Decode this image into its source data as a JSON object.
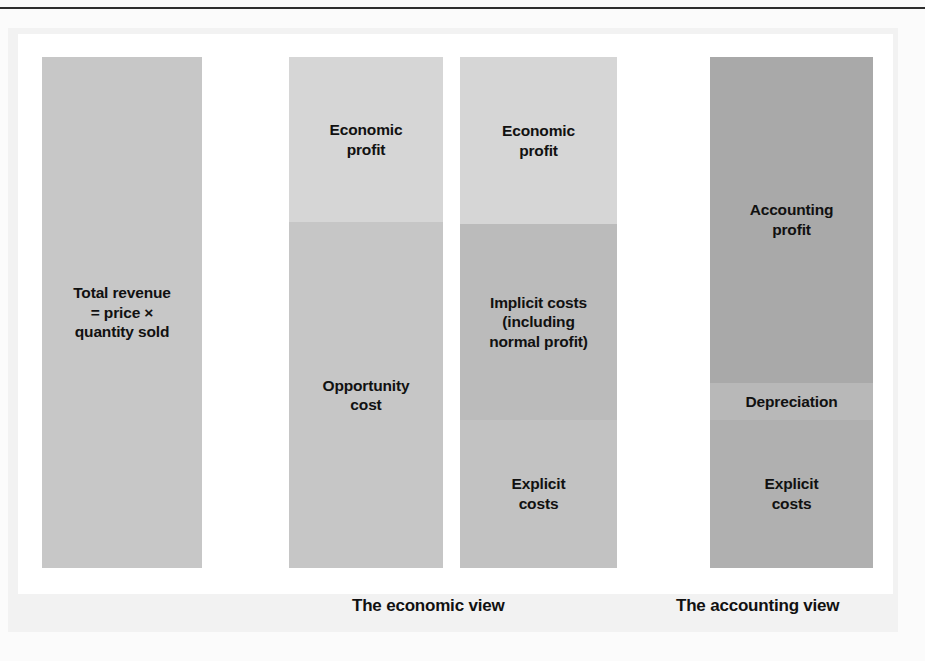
{
  "figure": {
    "bars": [
      {
        "name": "total-revenue",
        "x": 42,
        "y": 57,
        "width": 160,
        "height": 511,
        "segments": [
          {
            "name": "total-revenue",
            "label": "Total revenue\n= price ×\nquantity sold",
            "color": "#c7c7c7",
            "height_pct": 100,
            "align": "center"
          }
        ]
      },
      {
        "name": "economic-view-revenue-split",
        "x": 289,
        "y": 57,
        "width": 154,
        "height": 511,
        "segments": [
          {
            "name": "economic-profit",
            "label": "Economic\nprofit",
            "color": "#d6d6d6",
            "height_pct": 32.3,
            "align": "center"
          },
          {
            "name": "opportunity-cost",
            "label": "Opportunity\ncost",
            "color": "#c6c6c6",
            "height_pct": 67.7,
            "align": "center"
          }
        ]
      },
      {
        "name": "economic-view-cost-split",
        "x": 460,
        "y": 57,
        "width": 157,
        "height": 511,
        "segments": [
          {
            "name": "economic-profit",
            "label": "Economic\nprofit",
            "color": "#d6d6d6",
            "height_pct": 32.7,
            "align": "center"
          },
          {
            "name": "implicit-costs",
            "label": "Implicit costs\n(including\nnormal profit)",
            "color": "#bbbbbb",
            "height_pct": 38.3,
            "align": "center"
          },
          {
            "name": "explicit-costs",
            "label": "Explicit\ncosts",
            "color": "#c2c2c2",
            "height_pct": 29.0,
            "align": "center"
          }
        ]
      },
      {
        "name": "accounting-view",
        "x": 710,
        "y": 57,
        "width": 163,
        "height": 511,
        "segments": [
          {
            "name": "accounting-profit",
            "label": "Accounting\nprofit",
            "color": "#a9a9a9",
            "height_pct": 63.8,
            "align": "center"
          },
          {
            "name": "depreciation",
            "label": "Depreciation",
            "color": "#b8b8b8",
            "height_pct": 7.2,
            "align": "center"
          },
          {
            "name": "explicit-costs",
            "label": "Explicit\ncosts",
            "color": "#b0b0b0",
            "height_pct": 29.0,
            "align": "center"
          }
        ]
      }
    ],
    "captions": [
      {
        "name": "economic-view-caption",
        "text": "The economic view",
        "x": 352,
        "y": 596
      },
      {
        "name": "accounting-view-caption",
        "text": "The accounting view",
        "x": 676,
        "y": 596
      }
    ],
    "bleed_through": [
      {
        "text": "the same thing",
        "x": 300,
        "y": 262
      },
      {
        "text": "economic profit is",
        "x": 296,
        "y": 283
      },
      {
        "text": "the difference",
        "x": 302,
        "y": 304
      },
      {
        "text": "between total",
        "x": 300,
        "y": 325
      },
      {
        "text": "revenue and",
        "x": 304,
        "y": 346
      },
      {
        "text": "opportunity cost",
        "x": 297,
        "y": 367
      },
      {
        "text": "so an",
        "x": 308,
        "y": 388
      },
      {
        "text": "economic",
        "x": 300,
        "y": 472
      },
      {
        "text": "profit can be",
        "x": 299,
        "y": 493
      },
      {
        "text": "made if the",
        "x": 301,
        "y": 514
      },
      {
        "text": "firm earns",
        "x": 303,
        "y": 535
      }
    ]
  },
  "colors": {
    "page_background": "#fbfbfb",
    "plate_background": "#ffffff",
    "frame_background": "#f2f2f2",
    "rule": "#2e2e2e",
    "text": "#111111"
  }
}
